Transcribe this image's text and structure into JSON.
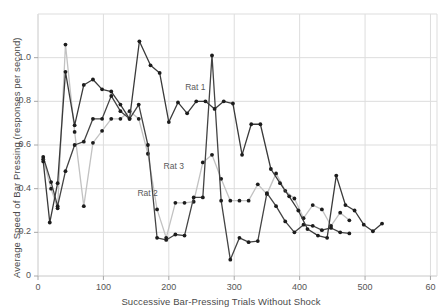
{
  "chart_data": {
    "type": "line",
    "title": "",
    "xlabel": "Successive Bar-Pressing Trials Without Shock",
    "ylabel": "Average Speed of Bar Pressing (responses per second)",
    "xlim": [
      0,
      610
    ],
    "ylim": [
      0,
      1.2
    ],
    "xticks": [
      0,
      100,
      200,
      300,
      400,
      500,
      600
    ],
    "xticklabels": [
      "0",
      "100",
      "200",
      "300",
      "400",
      "500",
      "60"
    ],
    "yticks": [
      0,
      0.2,
      0.4,
      0.6,
      0.8,
      1.0
    ],
    "yticklabels": [
      "0",
      "0.2",
      "0.4",
      "0.6",
      "0.8",
      "1.0"
    ],
    "grid": true,
    "legend_position": "inline-annotations",
    "markers": "filled-circle",
    "series": [
      {
        "name": "Rat 1",
        "color": "#3a3a3a",
        "annotation": "Rat 1",
        "annotation_xy": [
          225,
          0.86
        ],
        "points": [
          [
            8,
            0.525
          ],
          [
            18,
            0.245
          ],
          [
            30,
            0.425
          ],
          [
            42,
            0.935
          ],
          [
            56,
            0.69
          ],
          [
            70,
            0.875
          ],
          [
            84,
            0.9
          ],
          [
            98,
            0.855
          ],
          [
            112,
            0.845
          ],
          [
            126,
            0.785
          ],
          [
            140,
            0.72
          ],
          [
            155,
            1.075
          ],
          [
            172,
            0.965
          ],
          [
            186,
            0.93
          ],
          [
            200,
            0.705
          ],
          [
            214,
            0.795
          ],
          [
            228,
            0.745
          ],
          [
            242,
            0.8
          ],
          [
            256,
            0.8
          ],
          [
            270,
            0.765
          ],
          [
            284,
            0.8
          ],
          [
            298,
            0.79
          ],
          [
            312,
            0.555
          ],
          [
            326,
            0.695
          ],
          [
            340,
            0.695
          ],
          [
            356,
            0.49
          ],
          [
            370,
            0.425
          ],
          [
            384,
            0.365
          ],
          [
            398,
            0.3
          ],
          [
            412,
            0.215
          ],
          [
            428,
            0.185
          ],
          [
            442,
            0.175
          ],
          [
            456,
            0.46
          ],
          [
            470,
            0.325
          ],
          [
            484,
            0.3
          ],
          [
            498,
            0.235
          ],
          [
            512,
            0.205
          ],
          [
            526,
            0.24
          ]
        ]
      },
      {
        "name": "Rat 2",
        "color": "#444444",
        "annotation": "Rat 2",
        "annotation_xy": [
          152,
          0.375
        ],
        "points": [
          [
            8,
            0.545
          ],
          [
            20,
            0.43
          ],
          [
            30,
            0.32
          ],
          [
            42,
            0.48
          ],
          [
            56,
            0.6
          ],
          [
            70,
            0.615
          ],
          [
            84,
            0.72
          ],
          [
            98,
            0.72
          ],
          [
            112,
            0.825
          ],
          [
            126,
            0.755
          ],
          [
            140,
            0.72
          ],
          [
            154,
            0.785
          ],
          [
            168,
            0.6
          ],
          [
            182,
            0.175
          ],
          [
            196,
            0.165
          ],
          [
            210,
            0.19
          ],
          [
            224,
            0.185
          ],
          [
            238,
            0.36
          ],
          [
            252,
            0.36
          ],
          [
            266,
            1.01
          ],
          [
            280,
            0.345
          ],
          [
            294,
            0.075
          ],
          [
            308,
            0.175
          ],
          [
            322,
            0.155
          ],
          [
            336,
            0.16
          ],
          [
            350,
            0.38
          ],
          [
            364,
            0.32
          ],
          [
            378,
            0.25
          ],
          [
            392,
            0.2
          ],
          [
            406,
            0.235
          ],
          [
            420,
            0.23
          ],
          [
            434,
            0.21
          ],
          [
            448,
            0.22
          ],
          [
            462,
            0.2
          ],
          [
            476,
            0.195
          ]
        ]
      },
      {
        "name": "Rat 3",
        "color": "#c2c2c2",
        "annotation": "Rat 3",
        "annotation_xy": [
          192,
          0.5
        ],
        "points": [
          [
            8,
            0.535
          ],
          [
            20,
            0.4
          ],
          [
            30,
            0.31
          ],
          [
            42,
            1.06
          ],
          [
            56,
            0.66
          ],
          [
            70,
            0.32
          ],
          [
            84,
            0.61
          ],
          [
            98,
            0.665
          ],
          [
            112,
            0.72
          ],
          [
            126,
            0.72
          ],
          [
            140,
            0.755
          ],
          [
            154,
            0.72
          ],
          [
            168,
            0.56
          ],
          [
            182,
            0.305
          ],
          [
            196,
            0.175
          ],
          [
            210,
            0.335
          ],
          [
            224,
            0.335
          ],
          [
            238,
            0.34
          ],
          [
            252,
            0.52
          ],
          [
            266,
            0.555
          ],
          [
            280,
            0.445
          ],
          [
            294,
            0.345
          ],
          [
            308,
            0.345
          ],
          [
            322,
            0.345
          ],
          [
            336,
            0.42
          ],
          [
            350,
            0.375
          ],
          [
            364,
            0.47
          ],
          [
            378,
            0.39
          ],
          [
            392,
            0.355
          ],
          [
            406,
            0.265
          ],
          [
            420,
            0.325
          ],
          [
            434,
            0.305
          ],
          [
            448,
            0.23
          ],
          [
            462,
            0.29
          ],
          [
            476,
            0.255
          ]
        ]
      }
    ]
  },
  "axes": {
    "plot_left_px": 38,
    "plot_right_px": 437,
    "plot_top_px": 14,
    "plot_bottom_px": 276
  }
}
